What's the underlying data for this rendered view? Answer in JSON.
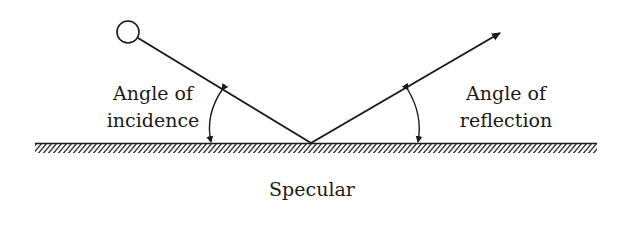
{
  "diagram": {
    "incidence_label": {
      "line1": "Angle of",
      "line2": "incidence"
    },
    "reflection_label": {
      "line1": "Angle of",
      "line2": "reflection"
    },
    "caption": "Specular",
    "colors": {
      "ink": "#1a1a1a",
      "background": "#ffffff"
    }
  }
}
